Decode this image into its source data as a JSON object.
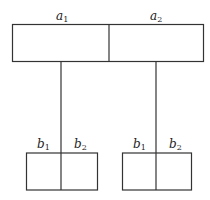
{
  "diagram": {
    "top_box": {
      "cells": [
        {
          "label": "a",
          "subscript": "1"
        },
        {
          "label": "a",
          "subscript": "2"
        }
      ]
    },
    "bottom_boxes": [
      {
        "cells": [
          {
            "label": "b",
            "subscript": "1"
          },
          {
            "label": "b",
            "subscript": "2"
          }
        ]
      },
      {
        "cells": [
          {
            "label": "b",
            "subscript": "1"
          },
          {
            "label": "b",
            "subscript": "2"
          }
        ]
      }
    ],
    "colors": {
      "line": "#333333",
      "background": "#ffffff"
    }
  }
}
